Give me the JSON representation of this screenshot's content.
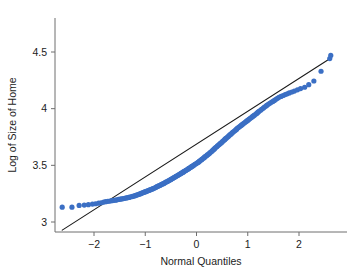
{
  "figure": {
    "kind": "qq-plot",
    "background_color": "#ffffff",
    "width": 351,
    "height": 274
  },
  "chart_data": {
    "type": "scatter",
    "title": "",
    "subtitle": "",
    "xlabel": "Normal Quantiles",
    "ylabel": "Log of Size of Home",
    "xlim": [
      -2.75,
      2.78
    ],
    "ylim": [
      2.865,
      4.58
    ],
    "xticks": [
      -2,
      -1,
      0,
      1,
      2
    ],
    "xtick_labels": [
      "−2",
      "−1",
      "0",
      "1",
      "2"
    ],
    "yticks": [
      3,
      3.5,
      4,
      4.5
    ],
    "ytick_labels": [
      "3",
      "3.5",
      "4",
      "4.5"
    ],
    "grid": false,
    "legend": null,
    "legend_position": "none",
    "series": [
      {
        "name": "Sample quantiles",
        "type": "scatter",
        "marker": "circle",
        "marker_size": 2.6,
        "color": "#3b6fc4",
        "points": [
          [
            -2.62,
            3.131
          ],
          [
            -2.43,
            3.131
          ],
          [
            -2.29,
            3.146
          ],
          [
            -2.19,
            3.149
          ],
          [
            -2.11,
            3.153
          ],
          [
            -2.03,
            3.158
          ],
          [
            -1.97,
            3.161
          ],
          [
            -1.91,
            3.166
          ],
          [
            -1.86,
            3.17
          ],
          [
            -1.81,
            3.176
          ],
          [
            -1.77,
            3.179
          ],
          [
            -1.73,
            3.182
          ],
          [
            -1.69,
            3.185
          ],
          [
            -1.65,
            3.188
          ],
          [
            -1.61,
            3.191
          ],
          [
            -1.58,
            3.193
          ],
          [
            -1.55,
            3.196
          ],
          [
            -1.52,
            3.199
          ],
          [
            -1.49,
            3.201
          ],
          [
            -1.46,
            3.204
          ],
          [
            -1.43,
            3.207
          ],
          [
            -1.4,
            3.209
          ],
          [
            -1.37,
            3.212
          ],
          [
            -1.35,
            3.214
          ],
          [
            -1.32,
            3.217
          ],
          [
            -1.3,
            3.22
          ],
          [
            -1.27,
            3.223
          ],
          [
            -1.25,
            3.226
          ],
          [
            -1.22,
            3.229
          ],
          [
            -1.2,
            3.232
          ],
          [
            -1.18,
            3.236
          ],
          [
            -1.16,
            3.239
          ],
          [
            -1.13,
            3.243
          ],
          [
            -1.11,
            3.247
          ],
          [
            -1.09,
            3.25
          ],
          [
            -1.07,
            3.254
          ],
          [
            -1.05,
            3.258
          ],
          [
            -1.03,
            3.261
          ],
          [
            -1.01,
            3.265
          ],
          [
            -0.99,
            3.268
          ],
          [
            -0.97,
            3.272
          ],
          [
            -0.95,
            3.275
          ],
          [
            -0.93,
            3.279
          ],
          [
            -0.91,
            3.283
          ],
          [
            -0.89,
            3.286
          ],
          [
            -0.87,
            3.29
          ],
          [
            -0.85,
            3.294
          ],
          [
            -0.83,
            3.298
          ],
          [
            -0.81,
            3.302
          ],
          [
            -0.79,
            3.306
          ],
          [
            -0.78,
            3.31
          ],
          [
            -0.76,
            3.314
          ],
          [
            -0.74,
            3.318
          ],
          [
            -0.72,
            3.322
          ],
          [
            -0.7,
            3.326
          ],
          [
            -0.69,
            3.33
          ],
          [
            -0.67,
            3.334
          ],
          [
            -0.65,
            3.338
          ],
          [
            -0.63,
            3.342
          ],
          [
            -0.62,
            3.346
          ],
          [
            -0.6,
            3.351
          ],
          [
            -0.58,
            3.355
          ],
          [
            -0.56,
            3.359
          ],
          [
            -0.55,
            3.363
          ],
          [
            -0.53,
            3.368
          ],
          [
            -0.51,
            3.372
          ],
          [
            -0.5,
            3.376
          ],
          [
            -0.48,
            3.381
          ],
          [
            -0.46,
            3.385
          ],
          [
            -0.45,
            3.39
          ],
          [
            -0.43,
            3.394
          ],
          [
            -0.41,
            3.399
          ],
          [
            -0.4,
            3.403
          ],
          [
            -0.38,
            3.408
          ],
          [
            -0.36,
            3.412
          ],
          [
            -0.35,
            3.417
          ],
          [
            -0.33,
            3.421
          ],
          [
            -0.31,
            3.426
          ],
          [
            -0.3,
            3.43
          ],
          [
            -0.28,
            3.435
          ],
          [
            -0.26,
            3.44
          ],
          [
            -0.25,
            3.444
          ],
          [
            -0.23,
            3.449
          ],
          [
            -0.21,
            3.454
          ],
          [
            -0.2,
            3.458
          ],
          [
            -0.18,
            3.463
          ],
          [
            -0.16,
            3.468
          ],
          [
            -0.15,
            3.473
          ],
          [
            -0.13,
            3.478
          ],
          [
            -0.11,
            3.483
          ],
          [
            -0.1,
            3.488
          ],
          [
            -0.08,
            3.493
          ],
          [
            -0.06,
            3.498
          ],
          [
            -0.05,
            3.503
          ],
          [
            -0.03,
            3.509
          ],
          [
            -0.01,
            3.514
          ],
          [
            0.01,
            3.52
          ],
          [
            0.03,
            3.526
          ],
          [
            0.05,
            3.532
          ],
          [
            0.06,
            3.538
          ],
          [
            0.08,
            3.544
          ],
          [
            0.1,
            3.55
          ],
          [
            0.11,
            3.556
          ],
          [
            0.13,
            3.562
          ],
          [
            0.15,
            3.568
          ],
          [
            0.16,
            3.574
          ],
          [
            0.18,
            3.58
          ],
          [
            0.2,
            3.586
          ],
          [
            0.21,
            3.592
          ],
          [
            0.23,
            3.598
          ],
          [
            0.25,
            3.604
          ],
          [
            0.26,
            3.61
          ],
          [
            0.28,
            3.617
          ],
          [
            0.3,
            3.624
          ],
          [
            0.31,
            3.631
          ],
          [
            0.33,
            3.638
          ],
          [
            0.35,
            3.645
          ],
          [
            0.36,
            3.652
          ],
          [
            0.38,
            3.659
          ],
          [
            0.4,
            3.666
          ],
          [
            0.41,
            3.672
          ],
          [
            0.43,
            3.679
          ],
          [
            0.45,
            3.685
          ],
          [
            0.46,
            3.692
          ],
          [
            0.48,
            3.698
          ],
          [
            0.5,
            3.705
          ],
          [
            0.51,
            3.712
          ],
          [
            0.53,
            3.719
          ],
          [
            0.55,
            3.726
          ],
          [
            0.56,
            3.733
          ],
          [
            0.58,
            3.74
          ],
          [
            0.6,
            3.747
          ],
          [
            0.62,
            3.754
          ],
          [
            0.63,
            3.761
          ],
          [
            0.65,
            3.768
          ],
          [
            0.67,
            3.775
          ],
          [
            0.69,
            3.782
          ],
          [
            0.7,
            3.789
          ],
          [
            0.72,
            3.796
          ],
          [
            0.74,
            3.803
          ],
          [
            0.76,
            3.81
          ],
          [
            0.78,
            3.817
          ],
          [
            0.79,
            3.824
          ],
          [
            0.81,
            3.831
          ],
          [
            0.83,
            3.838
          ],
          [
            0.85,
            3.845
          ],
          [
            0.87,
            3.852
          ],
          [
            0.89,
            3.859
          ],
          [
            0.91,
            3.866
          ],
          [
            0.93,
            3.873
          ],
          [
            0.95,
            3.88
          ],
          [
            0.97,
            3.887
          ],
          [
            0.99,
            3.894
          ],
          [
            1.01,
            3.901
          ],
          [
            1.03,
            3.908
          ],
          [
            1.05,
            3.915
          ],
          [
            1.07,
            3.922
          ],
          [
            1.09,
            3.929
          ],
          [
            1.11,
            3.936
          ],
          [
            1.13,
            3.943
          ],
          [
            1.16,
            3.952
          ],
          [
            1.18,
            3.96
          ],
          [
            1.2,
            3.969
          ],
          [
            1.22,
            3.977
          ],
          [
            1.25,
            3.986
          ],
          [
            1.27,
            3.995
          ],
          [
            1.3,
            4.003
          ],
          [
            1.32,
            4.012
          ],
          [
            1.35,
            4.021
          ],
          [
            1.37,
            4.029
          ],
          [
            1.4,
            4.038
          ],
          [
            1.43,
            4.047
          ],
          [
            1.46,
            4.056
          ],
          [
            1.49,
            4.064
          ],
          [
            1.52,
            4.073
          ],
          [
            1.55,
            4.082
          ],
          [
            1.58,
            4.091
          ],
          [
            1.61,
            4.1
          ],
          [
            1.65,
            4.108
          ],
          [
            1.69,
            4.116
          ],
          [
            1.73,
            4.124
          ],
          [
            1.77,
            4.131
          ],
          [
            1.81,
            4.139
          ],
          [
            1.86,
            4.147
          ],
          [
            1.91,
            4.155
          ],
          [
            1.97,
            4.166
          ],
          [
            2.03,
            4.177
          ],
          [
            2.11,
            4.189
          ],
          [
            2.19,
            4.212
          ],
          [
            2.29,
            4.244
          ],
          [
            2.43,
            4.33
          ],
          [
            2.6,
            4.442
          ],
          [
            2.62,
            4.47
          ]
        ]
      },
      {
        "name": "Reference line",
        "type": "line",
        "color": "#1a1a1a",
        "width": 1.1,
        "x0": -2.62,
        "y0": 2.928,
        "x1": 2.6,
        "y1": 4.44
      }
    ]
  },
  "axes": {
    "x_axis_name": "Normal Quantiles",
    "y_axis_name": "Log of Size of Home",
    "spine_color": "#6e6e6e",
    "tick_color": "#6e6e6e",
    "tick_text_color": "#1c1c1c"
  }
}
